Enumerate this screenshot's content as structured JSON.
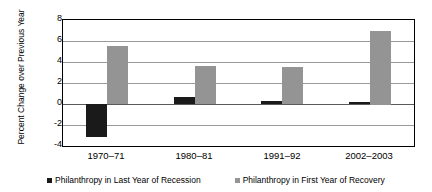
{
  "chart_data": {
    "type": "bar",
    "title": "",
    "subtitle": "",
    "xlabel": "",
    "ylabel": "Percent Change over Previous Year",
    "categories": [
      "1970–71",
      "1980–81",
      "1991–92",
      "2002–2003"
    ],
    "series": [
      {
        "name": "Philanthropy in Last Year of Recession",
        "color": "#1a1a1a",
        "values": [
          -3.1,
          0.7,
          0.3,
          0.2
        ]
      },
      {
        "name": "Philanthropy in First Year of Recovery",
        "color": "#949494",
        "values": [
          5.5,
          3.6,
          3.5,
          7.0
        ]
      }
    ],
    "ylim": [
      -4,
      8
    ],
    "ytick_values": [
      8,
      6,
      4,
      2,
      0,
      -2,
      -4
    ],
    "ytick_labels": [
      "8",
      "6",
      "4",
      "2",
      "0",
      "-2",
      "-4"
    ],
    "grid": true,
    "grid_axis": "y",
    "legend_position": "bottom",
    "zero_line": 0,
    "plot_background": "#ffffff",
    "frame": true
  },
  "legend": {
    "entries": [
      {
        "label": "Philanthropy in Last Year of Recession",
        "swatch": "legend-swatch-dark"
      },
      {
        "label": "Philanthropy in First Year of Recovery",
        "swatch": "legend-swatch-light"
      }
    ]
  }
}
